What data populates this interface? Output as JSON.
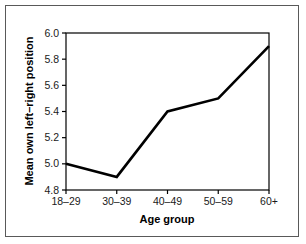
{
  "figure": {
    "border_color": "#595959",
    "background_color": "#ffffff"
  },
  "chart_data": {
    "type": "line",
    "title": "",
    "subtitle": "",
    "xlabel": "Age group",
    "ylabel": "Mean own left–right position",
    "categories": [
      "18–29",
      "30–39",
      "40–49",
      "50–59",
      "60+"
    ],
    "values": [
      5.0,
      4.9,
      5.4,
      5.5,
      5.9
    ],
    "series": [
      {
        "name": "Mean own left–right position",
        "values": [
          5.0,
          4.9,
          5.4,
          5.5,
          5.9
        ]
      }
    ],
    "ylim": [
      4.8,
      6.0
    ],
    "ytick_labels": [
      "4.8",
      "5.0",
      "5.2",
      "5.4",
      "5.6",
      "5.8",
      "6.0"
    ],
    "ytick_values": [
      4.8,
      5.0,
      5.2,
      5.4,
      5.6,
      5.8,
      6.0
    ],
    "xtick_labels": [
      "18–29",
      "30–39",
      "40–49",
      "50–59",
      "60+"
    ],
    "grid": false,
    "legend": false,
    "legend_position": "none",
    "line_color": "#000000",
    "annotations": []
  }
}
